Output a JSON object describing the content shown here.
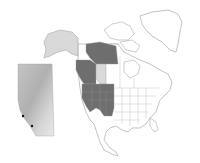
{
  "map": {
    "subject": "North America with highlighted western region and Alberta inset",
    "colors": {
      "background": "#ffffff",
      "outline": "#9a9a9a",
      "highlight_dark": "#6e6e6e",
      "highlight_light": "#d9d9d9",
      "inset_base": "#c8c8c8",
      "inset_dark": "#a8a8a8",
      "inset_light": "#e4e4e4",
      "point": "#111111"
    },
    "highlighted_dark_regions": [
      "Yukon/Northwest Territories (west)",
      "British Columbia",
      "Washington",
      "Oregon",
      "California",
      "Idaho",
      "Nevada",
      "Montana",
      "Wyoming",
      "Utah",
      "Colorado"
    ],
    "highlighted_light_regions": [
      "Alaska",
      "Alberta"
    ],
    "inset": {
      "region": "Alberta",
      "points": [
        {
          "x": 23,
          "y": 116
        },
        {
          "x": 32,
          "y": 126
        }
      ]
    }
  }
}
